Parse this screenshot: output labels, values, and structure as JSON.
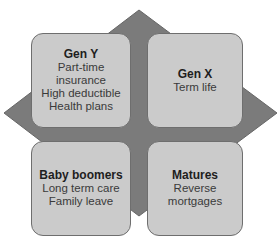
{
  "diagram": {
    "background_shape": "diamond",
    "colors": {
      "diamond": "#7b7b7b",
      "box_fill": "#cbcbcb",
      "box_border": "#6e6e6e",
      "title_text": "#1e1e1e",
      "body_text": "#3a3a3a"
    },
    "quadrants": [
      {
        "position": "top-left",
        "title": "Gen Y",
        "lines": [
          "Part-time",
          "insurance",
          "High deductible",
          "Health plans"
        ]
      },
      {
        "position": "top-right",
        "title": "Gen X",
        "lines": [
          "Term life"
        ]
      },
      {
        "position": "bottom-left",
        "title": "Baby boomers",
        "lines": [
          "Long term care",
          "Family leave"
        ]
      },
      {
        "position": "bottom-right",
        "title": "Matures",
        "lines": [
          "Reverse",
          "mortgages"
        ]
      }
    ]
  }
}
